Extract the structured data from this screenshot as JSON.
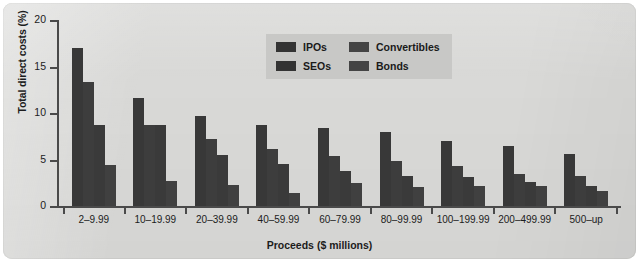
{
  "chart_data": {
    "type": "bar",
    "title": "",
    "xlabel": "Proceeds ($ millions)",
    "ylabel": "Total direct costs (%)",
    "ylim": [
      0,
      20
    ],
    "yticks": [
      0,
      5,
      10,
      15,
      20
    ],
    "ytick_labels": [
      "0",
      "5",
      "10",
      "15",
      "20"
    ],
    "grid": false,
    "legend_position": "top-center",
    "categories": [
      "2–9.99",
      "10–19.99",
      "20–39.99",
      "40–59.99",
      "60–79.99",
      "80–99.99",
      "100–199.99",
      "200–499.99",
      "500–up"
    ],
    "series": [
      {
        "name": "IPOs",
        "color": "#383838",
        "values": [
          17.0,
          11.6,
          9.7,
          8.7,
          8.4,
          8.0,
          7.0,
          6.5,
          5.6
        ]
      },
      {
        "name": "SEOs",
        "color": "#3d3d3d",
        "values": [
          13.3,
          8.7,
          7.2,
          6.1,
          5.4,
          4.8,
          4.3,
          3.4,
          3.2
        ]
      },
      {
        "name": "Convertibles",
        "color": "#3a3a3a",
        "values": [
          8.7,
          8.7,
          5.5,
          4.5,
          3.8,
          3.2,
          3.1,
          2.6,
          2.2
        ]
      },
      {
        "name": "Bonds",
        "color": "#404040",
        "values": [
          4.4,
          2.7,
          2.3,
          1.4,
          2.5,
          2.0,
          2.2,
          2.1,
          1.6
        ]
      }
    ]
  },
  "legend": {
    "items": [
      {
        "label": "IPOs"
      },
      {
        "label": "Convertibles"
      },
      {
        "label": "SEOs"
      },
      {
        "label": "Bonds"
      }
    ]
  }
}
